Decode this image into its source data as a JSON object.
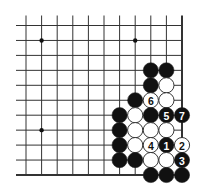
{
  "diagram": {
    "type": "go-board-corner",
    "corner": "bottom-right",
    "columns": 11,
    "rows": 11,
    "colors": {
      "black": "#111111",
      "white": "#ffffff",
      "line": "#333333"
    },
    "star_points": [
      {
        "col": 1,
        "row": 1
      },
      {
        "col": 7,
        "row": 1
      },
      {
        "col": 1,
        "row": 7
      }
    ],
    "stones": [
      {
        "col": 8,
        "row": 3,
        "color": "black",
        "label": ""
      },
      {
        "col": 9,
        "row": 3,
        "color": "black",
        "label": ""
      },
      {
        "col": 8,
        "row": 4,
        "color": "black",
        "label": ""
      },
      {
        "col": 9,
        "row": 4,
        "color": "white",
        "label": ""
      },
      {
        "col": 7,
        "row": 5,
        "color": "black",
        "label": ""
      },
      {
        "col": 8,
        "row": 5,
        "color": "white",
        "label": "6"
      },
      {
        "col": 9,
        "row": 5,
        "color": "white",
        "label": ""
      },
      {
        "col": 6,
        "row": 6,
        "color": "black",
        "label": ""
      },
      {
        "col": 7,
        "row": 6,
        "color": "white",
        "label": ""
      },
      {
        "col": 8,
        "row": 6,
        "color": "black",
        "label": ""
      },
      {
        "col": 9,
        "row": 6,
        "color": "black",
        "label": "5"
      },
      {
        "col": 10,
        "row": 6,
        "color": "black",
        "label": "7"
      },
      {
        "col": 6,
        "row": 7,
        "color": "black",
        "label": ""
      },
      {
        "col": 7,
        "row": 7,
        "color": "white",
        "label": ""
      },
      {
        "col": 8,
        "row": 7,
        "color": "white",
        "label": ""
      },
      {
        "col": 9,
        "row": 7,
        "color": "white",
        "label": ""
      },
      {
        "col": 6,
        "row": 8,
        "color": "black",
        "label": ""
      },
      {
        "col": 7,
        "row": 8,
        "color": "white",
        "label": ""
      },
      {
        "col": 8,
        "row": 8,
        "color": "white",
        "label": "4"
      },
      {
        "col": 9,
        "row": 8,
        "color": "black",
        "label": "1"
      },
      {
        "col": 10,
        "row": 8,
        "color": "white",
        "label": "2"
      },
      {
        "col": 6,
        "row": 9,
        "color": "black",
        "label": ""
      },
      {
        "col": 7,
        "row": 9,
        "color": "black",
        "label": ""
      },
      {
        "col": 8,
        "row": 9,
        "color": "white",
        "label": ""
      },
      {
        "col": 9,
        "row": 9,
        "color": "white",
        "label": ""
      },
      {
        "col": 10,
        "row": 9,
        "color": "black",
        "label": "3"
      },
      {
        "col": 8,
        "row": 10,
        "color": "black",
        "label": ""
      },
      {
        "col": 9,
        "row": 10,
        "color": "black",
        "label": ""
      },
      {
        "col": 10,
        "row": 10,
        "color": "black",
        "label": ""
      }
    ]
  }
}
